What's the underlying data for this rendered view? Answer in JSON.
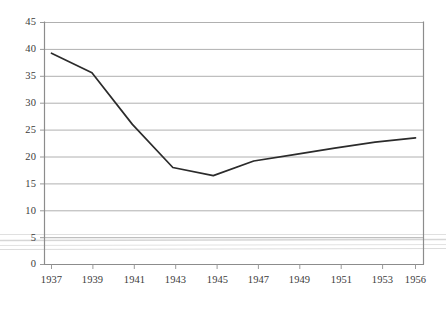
{
  "chart_data": {
    "type": "line",
    "title": "",
    "subtitle": "",
    "xlabel": "",
    "ylabel": "",
    "x": [
      1937,
      1939,
      1941,
      1943,
      1945,
      1947,
      1949,
      1951,
      1953,
      1956
    ],
    "categories": [
      "1937",
      "1939",
      "1941",
      "1943",
      "1945",
      "1947",
      "1949",
      "1951",
      "1953",
      "1956"
    ],
    "values": [
      39.2,
      35.6,
      26.0,
      18.0,
      16.5,
      19.2,
      20.4,
      21.6,
      22.7,
      23.5
    ],
    "series": [
      {
        "name": "",
        "values": [
          39.2,
          35.6,
          26.0,
          18.0,
          16.5,
          19.2,
          20.4,
          21.6,
          22.7,
          23.5
        ]
      }
    ],
    "xlim": [
      1937,
      1956
    ],
    "ylim": [
      0,
      45
    ],
    "yticks": [
      0,
      5,
      10,
      15,
      20,
      25,
      30,
      35,
      40,
      45
    ],
    "ytick_labels": [
      "0",
      "5",
      "10",
      "15",
      "20",
      "25",
      "30",
      "35",
      "40",
      "45"
    ],
    "xtick_labels": [
      "1937",
      "1939",
      "1941",
      "1943",
      "1945",
      "1947",
      "1949",
      "1951",
      "1953",
      "1956"
    ],
    "grid": "horizontal",
    "legend": "none",
    "line_color": "#2b2b2b",
    "grid_color": "#b0b0b0",
    "axis_color": "#8c8c8c",
    "text_color": "#3b3b3b",
    "background_color": "#ffffff",
    "markers": "none",
    "annotations": []
  },
  "artifacts": {
    "scan_lines_note": "faint horizontal scan streaks near value 5-6"
  }
}
